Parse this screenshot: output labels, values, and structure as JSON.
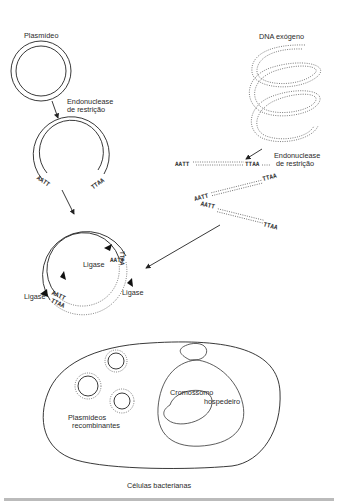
{
  "labels": {
    "plasmid": "Plasmídeo",
    "endonuclease_left_1": "Endonuclease",
    "endonuclease_left_2": "de restrição",
    "exogenous_dna": "DNA exógeno",
    "endonuclease_right_1": "Endonuclease",
    "endonuclease_right_2": "de restrição",
    "ligase_top": "Ligase",
    "ligase_left": "Ligase",
    "ligase_right": "Ligase",
    "recombinant_1": "Plasmídeos",
    "recombinant_2": "recombinantes",
    "chromosome_1": "Cromossomo",
    "chromosome_2": "hospedeiro",
    "bacterial_cells": "Células bacterianas"
  },
  "sequences": {
    "cut_plasmid_left": "AATT",
    "cut_plasmid_right": "TTAA",
    "fragment1_left": "AATT",
    "fragment1_right": "TTAA",
    "fragment2_left": "AATT",
    "fragment2_right": "TTAA",
    "fragment3_left": "AATT",
    "fragment3_right": "TTAA"
  },
  "colors": {
    "line": "#222222",
    "text": "#2a2a2a",
    "background": "#ffffff"
  }
}
